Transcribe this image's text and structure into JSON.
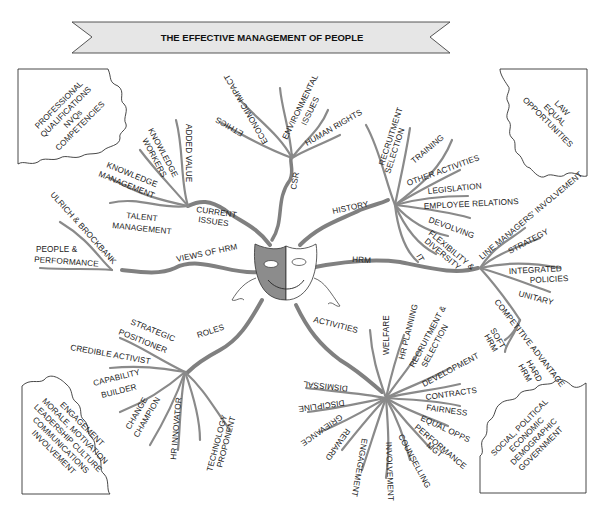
{
  "title": "THE EFFECTIVE MANAGEMENT OF PEOPLE",
  "center_icon": "theatre-mask-icon",
  "clouds": {
    "top_left": [
      "PROFESSIONAL",
      "QUALIFICATIONS",
      "NVQs",
      "COMPETENCIES"
    ],
    "top_right": [
      "LAW",
      "EQUAL",
      "OPPORTUNITIES"
    ],
    "bottom_left": [
      "ENGAGEMENT",
      "MORALE, MOTIVATION",
      "LEADERSHIP CULTURE",
      "COMMUNICATIONS",
      "INVOLVEMENT"
    ],
    "bottom_right": [
      "SOCIAL, POLITICAL",
      "ECONOMIC",
      "DEMOGRAPHIC",
      "GOVERNMENT"
    ]
  },
  "branches": {
    "current_issues": {
      "label": [
        "CURRENT",
        "ISSUES"
      ],
      "items": [
        "ADDED VALUE",
        "KNOWLEDGE WORKERS",
        "KNOWLEDGE MANAGEMENT",
        "TALENT MANAGEMENT"
      ]
    },
    "csr": {
      "label": "CSR",
      "items": [
        "ETHICS",
        "ECONOMIC IMPACT",
        "ENVIRONMENTAL ISSUES",
        "HUMAN RIGHTS"
      ]
    },
    "history": {
      "label": "HISTORY",
      "items": [
        "RECRUITMENT SELECTION",
        "TRAINING",
        "OTHER ACTIVITIES",
        "LEGISLATION",
        "EMPLOYEE RELATIONS",
        "DEVOLVING",
        "FLEXIBILITY & DIVERSITY",
        "IT"
      ]
    },
    "views_of_hrm": {
      "label": "VIEWS OF HRM",
      "items": [
        "ULRICH & BROCKBANK",
        "PEOPLE & PERFORMANCE"
      ]
    },
    "hrm": {
      "label": "HRM",
      "items": [
        "LINE MANAGERS' INVOLVEMENT",
        "STRATEGY",
        "INTEGRATED POLICIES",
        "UNITARY",
        "COMPETITIVE ADVANTAGE"
      ],
      "sub": [
        "SOFT HRM",
        "HARD HRM"
      ]
    },
    "roles": {
      "label": "ROLES",
      "items": [
        "STRATEGIC POSITIONER",
        "CREDIBLE ACTIVIST",
        "CAPABILITY BUILDER",
        "CHANGE CHAMPION",
        "HR INNOVATOR",
        "TECHNOLOGY PROPONENT"
      ]
    },
    "activities": {
      "label": "ACTIVITIES",
      "items": [
        "WELFARE",
        "HR PLANNING",
        "RECRUITMENT & SELECTION",
        "DEVELOPMENT",
        "CONTRACTS",
        "FAIRNESS",
        "EQUAL OPPS",
        "PERFORMANCE MGT",
        "COUNSELLING",
        "INVOLVEMENT",
        "ENGAGEMENT",
        "REWARD",
        "GRIEVANCE",
        "DISCIPLINE",
        "DISMISSAL"
      ]
    }
  },
  "labels": {
    "added_value": "ADDED VALUE",
    "knowledge_workers_1": "KNOWLEDGE",
    "knowledge_workers_2": "WORKERS",
    "knowledge_mgmt_1": "KNOWLEDGE",
    "knowledge_mgmt_2": "MANAGEMENT",
    "talent_1": "TALENT",
    "talent_2": "MANAGEMENT",
    "current_1": "CURRENT",
    "current_2": "ISSUES",
    "ethics": "ETHICS",
    "economic_impact": "ECONOMIC IMPACT",
    "environmental_1": "ENVIRONMENTAL",
    "environmental_2": "ISSUES",
    "human_rights": "HUMAN RIGHTS",
    "csr": "CSR",
    "history": "HISTORY",
    "recruitment_1": "RECRUITMENT",
    "recruitment_2": "SELECTION",
    "training": "TRAINING",
    "other_activities": "OTHER ACTIVITIES",
    "legislation": "LEGISLATION",
    "employee_relations": "EMPLOYEE RELATIONS",
    "devolving": "DEVOLVING",
    "flexibility_1": "FLEXIBILITY &",
    "flexibility_2": "DIVERSITY",
    "it": "IT",
    "ulrich": "ULRICH & BROCKBANK",
    "people_1": "PEOPLE &",
    "people_2": "PERFORMANCE",
    "views": "VIEWS OF HRM",
    "hrm": "HRM",
    "line_managers": "LINE MANAGERS' INVOLVEMENT",
    "strategy": "STRATEGY",
    "integrated_1": "INTEGRATED",
    "integrated_2": "POLICIES",
    "unitary": "UNITARY",
    "competitive": "COMPETITIVE ADVANTAGE",
    "soft_1": "SOFT",
    "soft_2": "HRM",
    "hard_1": "HARD",
    "hard_2": "HRM",
    "roles": "ROLES",
    "strategic_1": "STRATEGIC",
    "strategic_2": "POSITIONER",
    "credible": "CREDIBLE ACTIVIST",
    "capability_1": "CAPABILITY",
    "capability_2": "BUILDER",
    "change_1": "CHANGE",
    "change_2": "CHAMPION",
    "hr_innovator": "HR INNOVATOR",
    "technology_1": "TECHNOLOGY",
    "technology_2": "PROPONENT",
    "activities": "ACTIVITIES",
    "welfare": "WELFARE",
    "hr_planning": "HR PLANNING",
    "recsel_1": "RECRUITMENT &",
    "recsel_2": "SELECTION",
    "development": "DEVELOPMENT",
    "contracts": "CONTRACTS",
    "fairness": "FAIRNESS",
    "equal_opps": "EQUAL OPPS",
    "performance_1": "PERFORMANCE",
    "performance_2": "MGT",
    "counselling": "COUNSELLING",
    "involvement": "INVOLVEMENT",
    "engagement": "ENGAGEMENT",
    "reward": "REWARD",
    "grievance": "GRIEVANCE",
    "discipline": "DISCIPLINE",
    "dismissal": "DISMISSAL"
  }
}
